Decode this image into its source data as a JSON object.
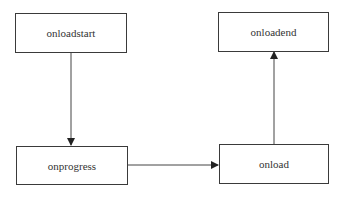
{
  "diagram": {
    "type": "flowchart",
    "nodes": [
      {
        "id": "onloadstart",
        "label": "onloadstart"
      },
      {
        "id": "onloadend",
        "label": "onloadend"
      },
      {
        "id": "onprogress",
        "label": "onprogress"
      },
      {
        "id": "onload",
        "label": "onload"
      }
    ],
    "edges": [
      {
        "from": "onloadstart",
        "to": "onprogress"
      },
      {
        "from": "onprogress",
        "to": "onload"
      },
      {
        "from": "onload",
        "to": "onloadend"
      }
    ]
  }
}
